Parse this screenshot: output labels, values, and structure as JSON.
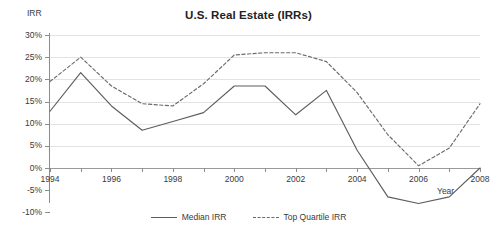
{
  "chart_data": {
    "type": "line",
    "title": "U.S. Real Estate (IRRs)",
    "xlabel": "Year",
    "ylabel": "IRR",
    "x": [
      1994,
      1995,
      1996,
      1997,
      1998,
      1999,
      2000,
      2001,
      2002,
      2003,
      2004,
      2005,
      2006,
      2007,
      2008
    ],
    "categories": [
      "1994",
      "1995",
      "1996",
      "1997",
      "1998",
      "1999",
      "2000",
      "2001",
      "2002",
      "2003",
      "2004",
      "2005",
      "2006",
      "2007",
      "2008"
    ],
    "xtick_labels": [
      "1994",
      "1996",
      "1998",
      "2000",
      "2002",
      "2004",
      "2006",
      "2008"
    ],
    "xtick_values": [
      1994,
      1996,
      1998,
      2000,
      2002,
      2004,
      2006,
      2008
    ],
    "ytick_labels": [
      "30%",
      "25%",
      "20%",
      "15%",
      "10%",
      "5%",
      "0%",
      "-5%",
      "-10%"
    ],
    "ytick_values": [
      30,
      25,
      20,
      15,
      10,
      5,
      0,
      -5,
      -10
    ],
    "ylim": [
      -10,
      30
    ],
    "xlim": [
      1994,
      2008
    ],
    "grid": true,
    "legend_position": "bottom",
    "series": [
      {
        "name": "Median IRR",
        "style": "solid",
        "color": "#5d5d5d",
        "values": [
          12.8,
          21.5,
          14.0,
          8.5,
          10.5,
          12.5,
          18.5,
          18.5,
          12.0,
          17.5,
          4.0,
          -6.5,
          -8.0,
          -6.5,
          0.0
        ]
      },
      {
        "name": "Top Quartile IRR",
        "style": "dashed",
        "color": "#6b6b6b",
        "values": [
          19.5,
          25.0,
          18.5,
          14.5,
          14.0,
          19.0,
          25.5,
          26.0,
          26.0,
          24.0,
          17.0,
          7.5,
          0.5,
          4.5,
          14.5
        ]
      }
    ]
  },
  "legend": {
    "entries": [
      {
        "label": "Median IRR",
        "style": "solid"
      },
      {
        "label": "Top Quartile IRR",
        "style": "dashed"
      }
    ]
  },
  "colors": {
    "median_line": "#5d5d5d",
    "top_quartile_line": "#6b6b6b",
    "gridline": "#e3e3e3",
    "axis": "#8c8c8c",
    "background": "#ffffff"
  }
}
